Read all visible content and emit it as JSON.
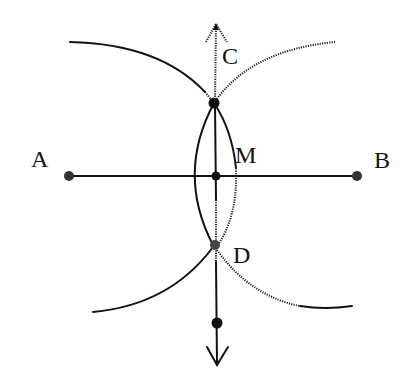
{
  "diagram": {
    "colors": {
      "ink": "#111111",
      "background": "#ffffff"
    },
    "points": [
      {
        "id": "A",
        "label": "A",
        "x": 68,
        "y": 176
      },
      {
        "id": "B",
        "label": "B",
        "x": 357,
        "y": 176
      },
      {
        "id": "M",
        "label": "M",
        "x": 216,
        "y": 176
      },
      {
        "id": "C",
        "label": "C",
        "x": 214,
        "y": 103
      },
      {
        "id": "D",
        "label": "D",
        "x": 215,
        "y": 245
      },
      {
        "id": "E",
        "label": "",
        "x": 217,
        "y": 323
      }
    ],
    "labels": {
      "A": "A",
      "B": "B",
      "C": "C",
      "D": "D",
      "M": "M"
    },
    "segments": [
      {
        "from": "A",
        "to": "B",
        "type": "segment"
      },
      {
        "from": "top-arrow",
        "to": "bottom-arrow",
        "type": "line-through-C-D"
      }
    ],
    "arcs": [
      {
        "center": "B",
        "description": "upper-left arc through C"
      },
      {
        "center": "A",
        "description": "upper-right arc through C"
      },
      {
        "center": "B",
        "description": "lower-left arc through D"
      },
      {
        "center": "A",
        "description": "lower-right arc through D"
      },
      {
        "description": "lens left arc C to D"
      },
      {
        "description": "lens right arc C to D"
      }
    ]
  }
}
